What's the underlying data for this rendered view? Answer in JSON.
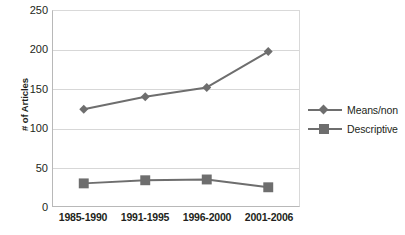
{
  "chart_data": {
    "type": "line",
    "title": "",
    "xlabel": "",
    "ylabel": "# of Articles",
    "categories": [
      "1985-1990",
      "1991-1995",
      "1996-2000",
      "2001-2006"
    ],
    "series": [
      {
        "name": "Means/non",
        "marker": "diamond",
        "color": "#6e6e6e",
        "values": [
          124,
          140,
          152,
          198
        ]
      },
      {
        "name": "Descriptive",
        "marker": "square",
        "color": "#6e6e6e",
        "values": [
          29,
          33,
          34,
          24
        ]
      }
    ],
    "ylim": [
      0,
      250
    ],
    "ytick_labels": [
      "0",
      "50",
      "100",
      "150",
      "200",
      "250"
    ],
    "ytick_values": [
      0,
      50,
      100,
      150,
      200,
      250
    ],
    "grid": "horizontal",
    "legend_position": "right",
    "axis_color": "#b8b8b8",
    "grid_color": "#d7d7d7",
    "text_color": "#231f20",
    "background": "#ffffff"
  },
  "legend": {
    "entries": [
      {
        "label": "Means/non",
        "marker": "diamond-marker-icon"
      },
      {
        "label": "Descriptive",
        "marker": "square-marker-icon"
      }
    ]
  }
}
